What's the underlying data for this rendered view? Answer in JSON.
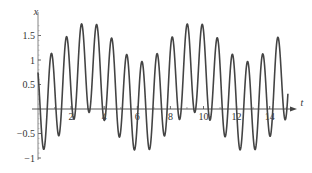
{
  "chart_data": {
    "type": "line",
    "title": "",
    "xlabel": "t",
    "ylabel": "x",
    "xlim": [
      0,
      15.3
    ],
    "ylim": [
      -1.05,
      1.9
    ],
    "grid": false,
    "legend": null,
    "x_ticks": [
      2,
      4,
      6,
      8,
      10,
      12,
      14
    ],
    "x_tick_labels": [
      "2",
      "4",
      "6",
      "8",
      "10",
      "12",
      "14"
    ],
    "y_ticks": [
      -1,
      -0.5,
      0.5,
      1,
      1.5
    ],
    "y_tick_labels": [
      "−1",
      "−0.5",
      "0.5",
      "1",
      "1.5"
    ],
    "series": [
      {
        "name": "x(t)",
        "color": "#444444",
        "t_range": [
          0,
          15.1
        ],
        "description": "fast oscillation (period ~0.91) with slowly varying center (period ~6.4)",
        "peaks": [
          {
            "t": 0.95,
            "x": 1.41
          },
          {
            "t": 1.88,
            "x": 1.65
          },
          {
            "t": 2.8,
            "x": 1.78
          },
          {
            "t": 3.7,
            "x": 1.76
          },
          {
            "t": 4.6,
            "x": 1.61
          },
          {
            "t": 5.45,
            "x": 1.37
          },
          {
            "t": 6.35,
            "x": 0.98
          },
          {
            "t": 7.3,
            "x": 1.41
          },
          {
            "t": 8.2,
            "x": 1.65
          },
          {
            "t": 9.15,
            "x": 1.78
          },
          {
            "t": 10.05,
            "x": 1.74
          },
          {
            "t": 10.95,
            "x": 1.59
          },
          {
            "t": 11.9,
            "x": 1.33
          },
          {
            "t": 12.85,
            "x": 0.98
          },
          {
            "t": 13.8,
            "x": 1.41
          },
          {
            "t": 14.7,
            "x": 1.65
          }
        ],
        "troughs": [
          {
            "t": 0.42,
            "x": -0.78
          },
          {
            "t": 1.4,
            "x": -0.43
          },
          {
            "t": 2.3,
            "x": -0.14
          },
          {
            "t": 3.2,
            "x": -0.1
          },
          {
            "t": 4.1,
            "x": -0.25
          },
          {
            "t": 5.0,
            "x": -0.49
          },
          {
            "t": 5.95,
            "x": -0.84
          },
          {
            "t": 6.85,
            "x": -0.76
          },
          {
            "t": 7.75,
            "x": -0.47
          },
          {
            "t": 8.7,
            "x": -0.17
          },
          {
            "t": 9.6,
            "x": -0.08
          },
          {
            "t": 10.5,
            "x": -0.23
          },
          {
            "t": 11.5,
            "x": -0.47
          },
          {
            "t": 12.4,
            "x": -0.9
          },
          {
            "t": 13.3,
            "x": -0.73
          },
          {
            "t": 14.25,
            "x": -0.43
          }
        ],
        "model": {
          "center_mean": 0.45,
          "center_amp": 0.4,
          "center_period": 6.4,
          "center_peak_t": 3.05,
          "fast_amp": 0.92,
          "fast_period": 0.912,
          "fast_phase": 0.72
        }
      }
    ]
  }
}
